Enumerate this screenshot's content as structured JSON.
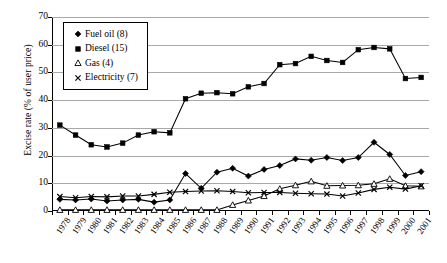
{
  "chart_data": {
    "type": "line",
    "title": "",
    "xlabel": "",
    "ylabel": "Excise rate (% of user price)",
    "ylim": [
      0,
      70
    ],
    "yticks": [
      0,
      10,
      20,
      30,
      40,
      50,
      60,
      70
    ],
    "grid": true,
    "legend_position": "top-left",
    "categories": [
      "1978",
      "1979",
      "1980",
      "1981",
      "1982",
      "1983",
      "1984",
      "1985",
      "1986",
      "1987",
      "1988",
      "1989",
      "1990",
      "1991",
      "1992",
      "1993",
      "1994",
      "1995",
      "1996",
      "1997",
      "1998",
      "1999",
      "2000",
      "2001"
    ],
    "series": [
      {
        "name": "Fuel oil (8)",
        "marker": "diamond",
        "values": [
          4.2,
          4.0,
          4.3,
          3.6,
          4.0,
          4.2,
          3.2,
          4.0,
          13.5,
          8.2,
          14.0,
          15.4,
          12.6,
          15.0,
          16.4,
          18.8,
          18.3,
          19.3,
          18.2,
          19.3,
          24.8,
          20.4,
          12.8,
          14.2
        ]
      },
      {
        "name": "Diesel (15)",
        "marker": "square",
        "values": [
          31.0,
          27.4,
          23.9,
          23.1,
          24.5,
          27.4,
          28.6,
          28.2,
          40.5,
          42.5,
          42.7,
          42.3,
          44.8,
          46.0,
          52.8,
          53.2,
          55.8,
          54.3,
          53.6,
          58.2,
          59.0,
          58.5,
          47.8,
          48.2
        ]
      },
      {
        "name": "Gas (4)",
        "marker": "triangle",
        "values": [
          0.4,
          0.4,
          0.4,
          0.4,
          0.4,
          0.4,
          0.4,
          0.4,
          0.4,
          0.4,
          0.4,
          2.2,
          3.8,
          5.4,
          8.0,
          9.3,
          10.7,
          9.1,
          9.2,
          9.3,
          9.8,
          11.6,
          9.1,
          8.9
        ]
      },
      {
        "name": "Electricity (7)",
        "marker": "cross",
        "values": [
          5.2,
          4.8,
          5.2,
          5.1,
          5.4,
          5.4,
          6.0,
          6.8,
          7.0,
          7.2,
          7.3,
          7.0,
          6.6,
          6.7,
          6.7,
          6.4,
          6.2,
          6.1,
          5.4,
          6.5,
          7.8,
          8.6,
          7.9,
          9.1
        ]
      }
    ]
  }
}
